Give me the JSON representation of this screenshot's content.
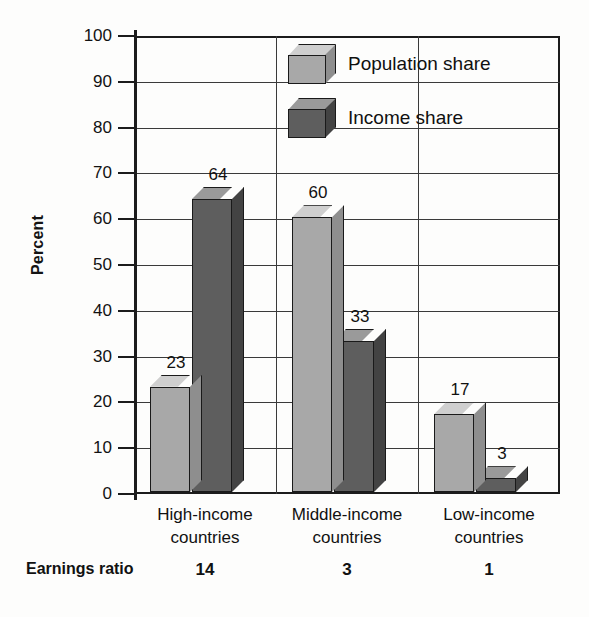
{
  "chart_data": {
    "type": "bar",
    "title": "",
    "subtitle": "",
    "xlabel": "",
    "ylabel": "Percent",
    "ylim": [
      0,
      100
    ],
    "ytick_step": 10,
    "yticks": [
      "100",
      "90",
      "80",
      "70",
      "60",
      "50",
      "40",
      "30",
      "20",
      "10",
      "0"
    ],
    "grid": true,
    "legend_position": "inside-top-center",
    "categories": [
      "High-income countries",
      "Middle-income countries",
      "Low-income countries"
    ],
    "category_lines": [
      [
        "High-income",
        "countries"
      ],
      [
        "Middle-income",
        "countries"
      ],
      [
        "Low-income",
        "countries"
      ]
    ],
    "series": [
      {
        "name": "Population share",
        "color": "#a8a8a8",
        "values": [
          23,
          60,
          17
        ]
      },
      {
        "name": "Income share",
        "color": "#5e5e5e",
        "values": [
          64,
          33,
          3
        ]
      }
    ],
    "annotations": {
      "row_label": "Earnings ratio",
      "row_values": [
        "14",
        "3",
        "1"
      ]
    }
  },
  "legend": {
    "items": [
      {
        "label": "Population share",
        "swatch": "light-cube-icon"
      },
      {
        "label": "Income share",
        "swatch": "dark-cube-icon"
      }
    ]
  },
  "colors": {
    "light_face": "#a8a8a8",
    "light_top": "#cfcfcf",
    "light_side": "#8e8e8e",
    "dark_face": "#5e5e5e",
    "dark_top": "#9a9a9a",
    "dark_side": "#434343",
    "axis": "#1c1c1c",
    "grid": "#3a3a3a",
    "background": "#fdfdfc",
    "text": "#111111"
  }
}
